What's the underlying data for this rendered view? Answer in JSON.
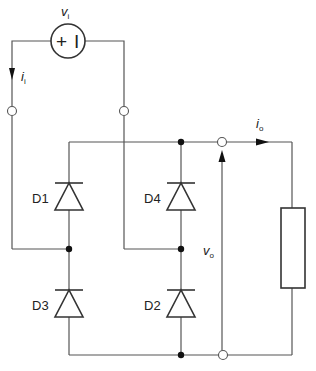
{
  "diagram": {
    "type": "full-wave bridge rectifier",
    "source": {
      "label_main": "v",
      "label_sub": "i",
      "plus_symbol": "+",
      "minus_symbol": "I"
    },
    "input_current": {
      "label_main": "i",
      "label_sub": "i"
    },
    "output_current": {
      "label_main": "i",
      "label_sub": "o"
    },
    "output_voltage": {
      "label_main": "v",
      "label_sub": "o"
    },
    "diodes": [
      {
        "id": "D1",
        "label": "D1"
      },
      {
        "id": "D4",
        "label": "D4"
      },
      {
        "id": "D3",
        "label": "D3"
      },
      {
        "id": "D2",
        "label": "D2"
      }
    ],
    "load": {
      "type": "resistor"
    },
    "colors": {
      "wire": "#555555",
      "component": "#333333",
      "node": "#111111",
      "background": "#ffffff"
    }
  }
}
